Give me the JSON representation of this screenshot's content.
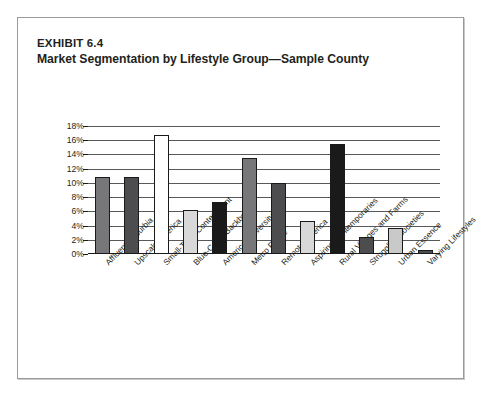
{
  "exhibit": {
    "number_label": "EXHIBIT 6.4",
    "title": "Market Segmentation by Lifestyle Group—Sample County"
  },
  "chart_data": {
    "type": "bar",
    "title": "Market Segmentation by Lifestyle Group—Sample County",
    "subtitle": "EXHIBIT 6.4",
    "xlabel": "",
    "ylabel": "",
    "ylim": [
      0,
      18
    ],
    "grid": true,
    "legend": "none",
    "y_tick_labels": [
      "0%",
      "2%",
      "4%",
      "6%",
      "8%",
      "10%",
      "12%",
      "14%",
      "16%",
      "18%"
    ],
    "y_tick_values": [
      0,
      2,
      4,
      6,
      8,
      10,
      12,
      14,
      16,
      18
    ],
    "categories": [
      "Affluent Suburbia",
      "Upscale America",
      "Small-Town Contentment",
      "Blue-Collar Backbone",
      "American Diversity",
      "Metro Fringe",
      "Remote America",
      "Aspiring Contemporaries",
      "Rural Villages and Farms",
      "Struggling Societies",
      "Urban Essence",
      "Varying Lifestyles"
    ],
    "values": [
      10.8,
      10.8,
      16.7,
      6.2,
      7.3,
      13.5,
      10.0,
      4.7,
      15.5,
      2.4,
      3.7,
      0.5
    ],
    "value_labels": [
      "10.8%",
      "10.8%",
      "16.7%",
      "6.2%",
      "7.3%",
      "13.5%",
      "10.0%",
      "4.7%",
      "15.5%",
      "2.4%",
      "3.7%",
      "0.5%"
    ],
    "bar_colors": [
      "#77777a",
      "#4d4d50",
      "#ffffff",
      "#d8d8d8",
      "#1a1a1a",
      "#77777a",
      "#4d4d50",
      "#d8d8d8",
      "#1a1a1a",
      "#4d4d50",
      "#c9c9c9",
      "#4d4d50"
    ]
  },
  "style": {
    "text_color": "#231f20",
    "gridline_color": "#595959",
    "frame_border_color": "#9a9a9a",
    "background": "#ffffff"
  }
}
